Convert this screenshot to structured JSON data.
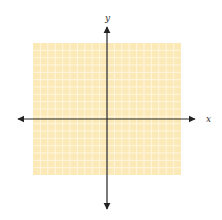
{
  "diagram": {
    "type": "coordinate-plane",
    "x_axis_label": "x",
    "y_axis_label": "y",
    "grid": {
      "left": 33,
      "top": 43,
      "width": 148,
      "height": 132,
      "columns": 20,
      "rows": 18,
      "fill_color": "#FBE9B8",
      "line_color": "#FFF6DE"
    },
    "origin": {
      "x": 107,
      "y": 119
    },
    "x_axis": {
      "from": 18,
      "to": 195
    },
    "y_axis": {
      "from": 27,
      "to": 209
    },
    "axis_color": "#222222"
  }
}
